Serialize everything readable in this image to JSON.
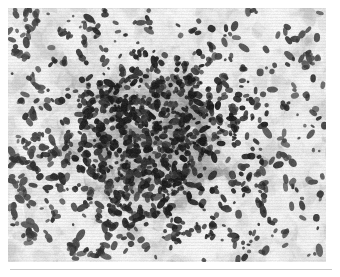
{
  "figure": {
    "kind": "photomicrograph",
    "modality": "light-microscopy",
    "stain_appearance": "grayscale",
    "caption": "",
    "plate": {
      "x": 8,
      "y": 8,
      "width": 318,
      "height": 254
    },
    "rule": {
      "x": 10,
      "y": 269,
      "width": 322,
      "height": 1,
      "color": "#c8c8c8"
    },
    "page_background": "#ffffff"
  },
  "palette": {
    "paper_white": "#ffffff",
    "field_lightest": "#f4f4f4",
    "field_light": "#e3e3e3",
    "field_mid": "#c4c4c4",
    "field_mid_dark": "#a6a6a6",
    "cluster_gray": "#8d8d8d",
    "nucleus_dark": "#3a3a3a",
    "nucleus_darkest": "#1e1e1e",
    "rule_gray": "#c8c8c8"
  },
  "render": {
    "seed": 20240517,
    "width": 318,
    "height": 254,
    "background_blob_count": 1500,
    "background_blob_radius": [
      4,
      16
    ],
    "midtone_blob_count": 620,
    "midtone_blob_radius": [
      3,
      11
    ],
    "cluster_center": [
      0.44,
      0.52
    ],
    "cluster_radius_x": 0.26,
    "cluster_radius_y": 0.3,
    "cluster_blob_count": 520,
    "nuclei_scattered_count": 430,
    "nuclei_cluster_count": 560,
    "nucleus_radius": [
      1.2,
      3.6
    ],
    "grain_amount": 12,
    "blur_px": 0.7
  }
}
